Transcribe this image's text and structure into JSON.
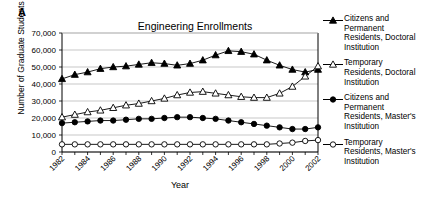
{
  "panel_label": "A",
  "axis": {
    "xlabel": "Year",
    "ylabel": "Number of Graduate Students"
  },
  "chart_data": {
    "type": "line",
    "title": "Engineering Enrollments",
    "xlabel": "Year",
    "ylabel": "Number of Graduate Students",
    "grid": true,
    "legend_position": "right",
    "xlim": [
      1982,
      2002
    ],
    "ylim": [
      0,
      70000
    ],
    "yticks": [
      0,
      10000,
      20000,
      30000,
      40000,
      50000,
      60000,
      70000
    ],
    "ytick_labels": [
      "0",
      "10,000",
      "20,000",
      "30,000",
      "40,000",
      "50,000",
      "60,000",
      "70,000"
    ],
    "xticks": [
      1982,
      1984,
      1986,
      1988,
      1990,
      1992,
      1994,
      1996,
      1998,
      2000,
      2002
    ],
    "xtick_labels": [
      "1982",
      "1984",
      "1986",
      "1988",
      "1990",
      "1992",
      "1994",
      "1996",
      "1998",
      "2000",
      "2002"
    ],
    "x": [
      1982,
      1983,
      1984,
      1985,
      1986,
      1987,
      1988,
      1989,
      1990,
      1991,
      1992,
      1993,
      1994,
      1995,
      1996,
      1997,
      1998,
      1999,
      2000,
      2001,
      2002
    ],
    "series": [
      {
        "name": "Citizens and Permanent Residents, Doctoral Institution",
        "marker": "filled-triangle",
        "color": "#000000",
        "values": [
          43000,
          45500,
          47000,
          49000,
          50000,
          50500,
          51500,
          52500,
          52000,
          51000,
          52000,
          54000,
          57000,
          59500,
          59000,
          57500,
          54000,
          51000,
          48500,
          47000,
          48500
        ]
      },
      {
        "name": "Temporary Residents, Doctoral Institution",
        "marker": "open-triangle",
        "color": "#000000",
        "values": [
          20500,
          22000,
          23500,
          24500,
          26000,
          27500,
          28500,
          30000,
          31500,
          33500,
          35000,
          35500,
          34500,
          33500,
          32500,
          32000,
          32000,
          34500,
          38500,
          44500,
          50500
        ]
      },
      {
        "name": "Citizens and Permanent Residents, Master's Institution",
        "marker": "filled-circle",
        "color": "#000000",
        "values": [
          17000,
          17500,
          18000,
          18500,
          18500,
          19000,
          19500,
          19500,
          20000,
          20500,
          20500,
          20000,
          19500,
          18500,
          17500,
          16500,
          15500,
          14500,
          13500,
          13500,
          14500
        ]
      },
      {
        "name": "Temporary Residents, Master's Institution",
        "marker": "open-circle",
        "color": "#000000",
        "values": [
          4500,
          4500,
          4500,
          4500,
          4500,
          4500,
          4500,
          4500,
          4500,
          4500,
          4500,
          4500,
          4500,
          4500,
          4500,
          4500,
          4500,
          5000,
          5500,
          6500,
          7000
        ]
      }
    ]
  },
  "legend": [
    {
      "marker": "filled-triangle",
      "label": "Citizens and\nPermanent\nResidents, Doctoral\nInstitution"
    },
    {
      "marker": "open-triangle",
      "label": "Temporary\nResidents, Doctoral\nInstitution"
    },
    {
      "marker": "filled-circle",
      "label": "Citizens and\nPermanent\nResidents, Master's\nInstitution"
    },
    {
      "marker": "open-circle",
      "label": "Temporary\nResidents, Master's\nInstitution"
    }
  ]
}
